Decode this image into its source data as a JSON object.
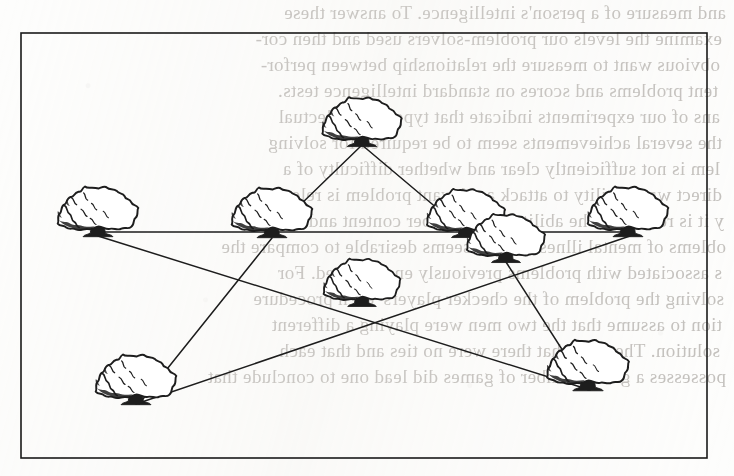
{
  "page": {
    "width": 734,
    "height": 476,
    "background_color": "#fdfdfc",
    "ink_color": "#1a1a1a",
    "bleed_text_color": "#b9b6b2"
  },
  "figure": {
    "caption": "",
    "border": {
      "shape": "rectangle",
      "stroke_color": "#1a1a1a",
      "stroke_width": 1.6,
      "x": 21,
      "y": 33,
      "width": 686,
      "height": 425
    },
    "tree_count": 9,
    "line_count": 10,
    "trees": [
      {
        "id": "t1",
        "label": "top-center",
        "x": 362,
        "y": 142
      },
      {
        "id": "t2",
        "label": "upper-left",
        "x": 98,
        "y": 232
      },
      {
        "id": "t3",
        "label": "mid-left",
        "x": 272,
        "y": 233
      },
      {
        "id": "t4",
        "label": "mid-right",
        "x": 466,
        "y": 233
      },
      {
        "id": "t5",
        "label": "mid-right-lower",
        "x": 506,
        "y": 258
      },
      {
        "id": "t6",
        "label": "upper-right",
        "x": 628,
        "y": 232
      },
      {
        "id": "t7",
        "label": "center",
        "x": 362,
        "y": 302
      },
      {
        "id": "t8",
        "label": "bottom-left",
        "x": 136,
        "y": 400
      },
      {
        "id": "t9",
        "label": "bottom-right",
        "x": 588,
        "y": 386
      }
    ],
    "connections": [
      {
        "from": "t1",
        "to": "t3",
        "name": "top-to-midleft"
      },
      {
        "from": "t1",
        "to": "t4",
        "name": "top-to-midright"
      },
      {
        "from": "t2",
        "to": "t6",
        "name": "horizontal-upper"
      },
      {
        "from": "t2",
        "to": "t9",
        "name": "left-to-bottomright"
      },
      {
        "from": "t8",
        "to": "t6",
        "name": "bottomleft-to-upperright"
      },
      {
        "from": "t5",
        "to": "t9",
        "name": "midrightlower-to-bottomright"
      },
      {
        "from": "t3",
        "to": "t8",
        "name": "midleft-to-bottomleft"
      }
    ]
  },
  "bleed_text": {
    "note": "Faint mirror-reversed text showing through from the reverse side of the page",
    "lines": [
      {
        "text": "and measure of a person's intelligence. To answer these",
        "x": 8,
        "y": 2
      },
      {
        "text": "examine the levels our problem-solvers used and then cor-",
        "x": 12,
        "y": 28
      },
      {
        "text": "obvious want to measure the relationship between perfor-",
        "x": 14,
        "y": 54
      },
      {
        "text": "tent problems and scores on standard intelligence tests.",
        "x": 16,
        "y": 80
      },
      {
        "text": "ans of our experiments indicate that type of intellectual",
        "x": 14,
        "y": 106
      },
      {
        "text": "the several achievements seem to be required for solving",
        "x": 12,
        "y": 132
      },
      {
        "text": "lem is not sufficiently clear and whether difficulty of a",
        "x": 14,
        "y": 158
      },
      {
        "text": "direct way. Ability to attack a relevant problem is relevant",
        "x": 12,
        "y": 184
      },
      {
        "text": "y it is relevant. The ability to remember content and a gen-",
        "x": 10,
        "y": 210
      },
      {
        "text": "oblems of mental illness, and it seems desirable to compare the",
        "x": 8,
        "y": 236
      },
      {
        "text": "s associated with problems previously encountered. For",
        "x": 12,
        "y": 262
      },
      {
        "text": "solving the problem of the checker players' each procedure",
        "x": 10,
        "y": 288
      },
      {
        "text": "tion to assume that the two men were playing a different",
        "x": 12,
        "y": 314
      },
      {
        "text": "solution. The facts that there were no ties and that each",
        "x": 14,
        "y": 340
      },
      {
        "text": "possesses a given number of games did lead one to conclude that",
        "x": 8,
        "y": 366
      }
    ]
  }
}
